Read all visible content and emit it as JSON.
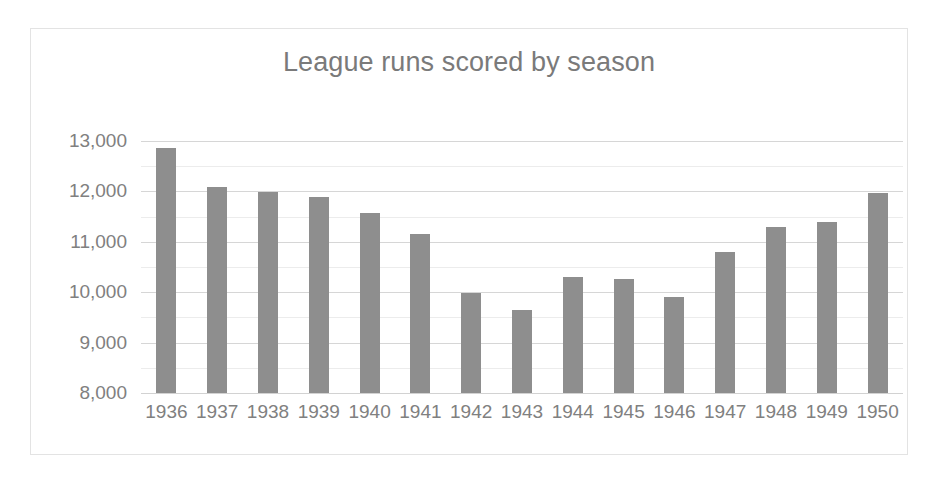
{
  "chart_data": {
    "type": "bar",
    "title": "League runs scored by season",
    "xlabel": "",
    "ylabel": "",
    "categories": [
      "1936",
      "1937",
      "1938",
      "1939",
      "1940",
      "1941",
      "1942",
      "1943",
      "1944",
      "1945",
      "1946",
      "1947",
      "1948",
      "1949",
      "1950"
    ],
    "values": [
      12870,
      12080,
      11980,
      11880,
      11570,
      11160,
      9980,
      9640,
      10310,
      10260,
      9900,
      10790,
      11290,
      11390,
      11970
    ],
    "ylim": [
      8000,
      13000
    ],
    "ytick_values": [
      8000,
      9000,
      10000,
      11000,
      12000,
      13000
    ],
    "ytick_labels": [
      "8,000",
      "9,000",
      "10,000",
      "11,000",
      "12,000",
      "13,000"
    ],
    "minor_ytick_values": [
      8500,
      9500,
      10500,
      11500,
      12500
    ],
    "grid": true,
    "legend": false,
    "legend_position": "none",
    "series": [
      {
        "name": "League runs scored",
        "color": "#8e8e8e",
        "values": [
          12870,
          12080,
          11980,
          11880,
          11570,
          11160,
          9980,
          9640,
          10310,
          10260,
          9900,
          10790,
          11290,
          11390,
          11970
        ]
      }
    ]
  },
  "style": {
    "bar_color": "#8e8e8e",
    "title_color": "#7a7a7a",
    "tick_color": "#808080",
    "gridline_color": "#d6d6d6",
    "minor_gridline_color": "#ececec",
    "frame_border_color": "#e3e3e3",
    "background": "#ffffff"
  }
}
